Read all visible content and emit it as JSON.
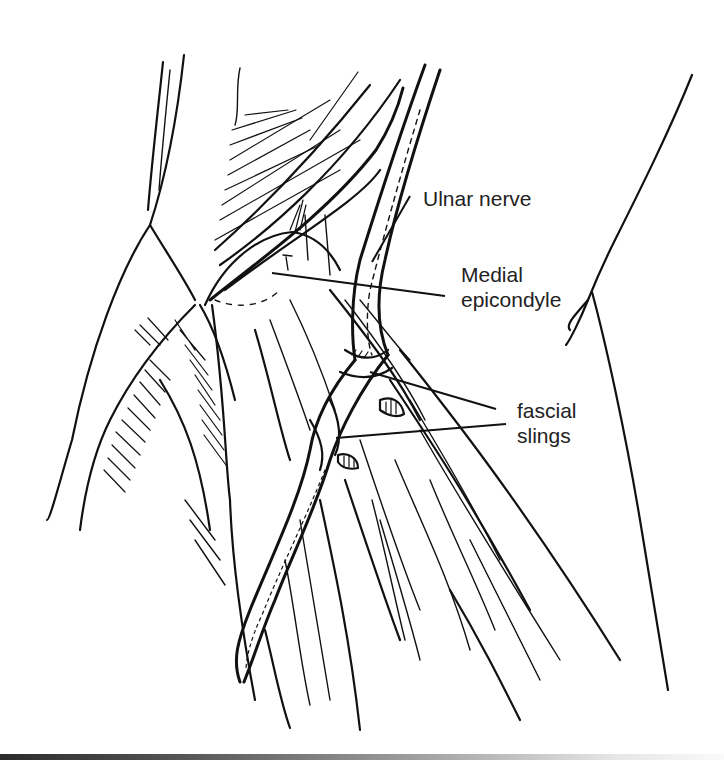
{
  "figure": {
    "style": "black ink line illustration on white",
    "colors": {
      "ink": "#111111",
      "background": "#ffffff",
      "label_text": "#222222"
    }
  },
  "labels": {
    "ulnar_nerve": "Ulnar nerve",
    "medial_epicondyle_line1": "Medial",
    "medial_epicondyle_line2": "epicondyle",
    "fascial_slings_line1": "fascial",
    "fascial_slings_line2": "slings"
  },
  "label_positions": {
    "ulnar_nerve": {
      "x": 423,
      "y": 188
    },
    "medial_epicondyle": {
      "x": 461,
      "y": 261
    },
    "fascial_slings": {
      "x": 517,
      "y": 398
    }
  }
}
